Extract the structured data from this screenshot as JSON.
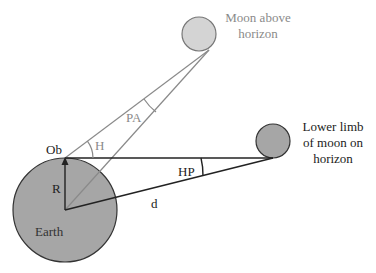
{
  "diagram": {
    "labels": {
      "moon_above": [
        "Moon above",
        "horizon"
      ],
      "moon_lower": [
        "Lower limb",
        "of moon on",
        "horizon"
      ],
      "observer": "Ob",
      "radius": "R",
      "earth": "Earth",
      "distance": "d",
      "horizontal_parallax": "HP",
      "altitude": "H",
      "parallax_in_altitude": "PA"
    },
    "colors": {
      "earth_fill": "#a6a6a6",
      "moon_upper_fill": "#d4d4d4",
      "moon_lower_fill": "#a6a6a6",
      "line_dark": "#222222",
      "line_gray": "#8a8a8a",
      "text_gray": "#8a8a8a",
      "text_dark": "#222222"
    }
  }
}
